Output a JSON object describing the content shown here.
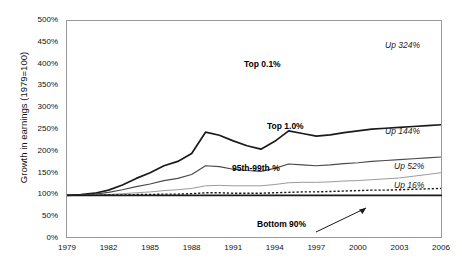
{
  "title": "",
  "axes": {
    "y_label": "Growth in earnings (1979=100)",
    "y_ticks": [
      "0%",
      "50%",
      "100%",
      "150%",
      "200%",
      "250%",
      "300%",
      "350%",
      "400%",
      "450%",
      "500%"
    ],
    "x_ticks": [
      "1979",
      "1982",
      "1985",
      "1988",
      "1991",
      "1994",
      "1997",
      "2000",
      "2003",
      "2006"
    ]
  },
  "labels": {
    "top01": "Top 0.1%",
    "top10": "Top 1.0%",
    "p95_99": "95th-99th %",
    "bottom90": "Bottom 90%"
  },
  "endnotes": {
    "top01": "Up 324%",
    "top10": "Up 144%",
    "p95_99": "Up 52%",
    "bottom90": "Up 16%"
  },
  "chart_data": {
    "type": "line",
    "title": "",
    "xlabel": "",
    "ylabel": "Growth in earnings (1979=100)",
    "xlim": [
      1979,
      2006
    ],
    "ylim": [
      0,
      500
    ],
    "grid": false,
    "legend": "inline-annotations",
    "x": [
      1979,
      1980,
      1981,
      1982,
      1983,
      1984,
      1985,
      1986,
      1987,
      1988,
      1989,
      1990,
      1991,
      1992,
      1993,
      1994,
      1995,
      1996,
      1997,
      1998,
      1999,
      2000,
      2001,
      2002,
      2003,
      2004,
      2005,
      2006
    ],
    "series": [
      {
        "name": "Top 0.1%",
        "color": "#1a1a1a",
        "style": "solid-thick",
        "end_label": "Up 324%",
        "values": [
          100,
          102,
          105,
          112,
          124,
          139,
          152,
          168,
          178,
          196,
          245,
          238,
          225,
          214,
          206,
          224,
          248,
          242,
          236,
          239,
          244,
          248,
          252,
          254,
          256,
          258,
          260,
          262
        ]
      },
      {
        "name": "Top 1.0%",
        "color": "#4a4a4a",
        "style": "solid-medium",
        "end_label": "Up 144%",
        "values": [
          100,
          101,
          103,
          107,
          113,
          120,
          126,
          134,
          139,
          148,
          168,
          166,
          160,
          157,
          155,
          162,
          172,
          170,
          168,
          170,
          173,
          175,
          178,
          180,
          182,
          184,
          186,
          188
        ]
      },
      {
        "name": "95th-99th %",
        "color": "#9b9b9b",
        "style": "solid-thin",
        "end_label": "Up 52%",
        "values": [
          100,
          100,
          101,
          102,
          104,
          106,
          108,
          111,
          113,
          116,
          122,
          123,
          122,
          122,
          122,
          125,
          129,
          130,
          130,
          131,
          133,
          134,
          136,
          138,
          140,
          144,
          148,
          152
        ]
      },
      {
        "name": "Bottom 90%",
        "color": "#1a1a1a",
        "style": "dotted",
        "end_label": "Up 16%",
        "values": [
          100,
          100,
          100,
          101,
          101,
          102,
          102,
          103,
          103,
          104,
          106,
          106,
          105,
          105,
          105,
          106,
          107,
          108,
          108,
          109,
          110,
          111,
          112,
          112,
          113,
          114,
          115,
          116
        ]
      }
    ],
    "baseline": 100
  }
}
